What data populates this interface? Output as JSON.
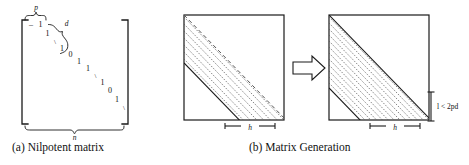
{
  "figure": {
    "background": "#ffffff",
    "line_color": "#1a1a1a",
    "hatch_color": "#555555"
  },
  "panel_a": {
    "caption": "(a) Nilpotent matrix",
    "brace_top_label": "p",
    "brace_diag_label": "d",
    "brace_bottom_label": "n",
    "diagonal_entries": [
      "1",
      "1",
      "1",
      "0",
      "1",
      "1",
      "1",
      "0",
      "1"
    ],
    "ellipsis_glyph": "\\",
    "left_bracket": "[",
    "right_bracket": "]"
  },
  "panel_b": {
    "caption": "(b) Matrix Generation",
    "arrow": "block-arrow-right",
    "left_square": {
      "name": "source-matrix",
      "dimension_label": "h",
      "band_lines": 7
    },
    "right_square": {
      "name": "generated-matrix",
      "dimension_label": "h",
      "vertical_label": "l < 2pd",
      "band_lines": 12
    }
  }
}
